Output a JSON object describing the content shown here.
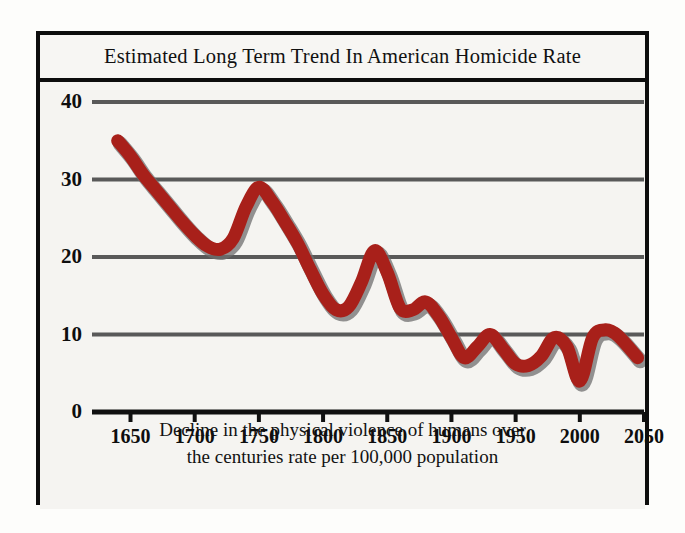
{
  "figure": {
    "title": "Estimated Long Term Trend In American Homicide Rate",
    "caption_line_1": "Decline in the physical violence of humans over",
    "caption_line_2": "the centuries rate per 100,000 population",
    "colors": {
      "line": "#a8201a",
      "line_shadow": "#6f6f6f",
      "gridline": "#595959",
      "axis": "#101010",
      "frame": "#0d0d0d",
      "background": "#f5f4f1",
      "text": "#111111"
    }
  },
  "chart_data": {
    "type": "line",
    "title": "Estimated Long Term Trend In American Homicide Rate",
    "subtitle": "Decline in the physical violence of humans over the centuries rate per 100,000 population",
    "xlabel": "",
    "ylabel": "",
    "xlim": [
      1620,
      2050
    ],
    "ylim": [
      0,
      40
    ],
    "grid": true,
    "legend": "none",
    "xticks": [
      1650,
      1700,
      1750,
      1800,
      1850,
      1900,
      1950,
      2000,
      2050
    ],
    "yticks": [
      0,
      10,
      20,
      30,
      40
    ],
    "series": [
      {
        "name": "American homicide rate (per 100,000 population)",
        "color": "#a8201a",
        "x": [
          1640,
          1650,
          1660,
          1670,
          1680,
          1690,
          1700,
          1710,
          1720,
          1730,
          1740,
          1750,
          1760,
          1770,
          1780,
          1790,
          1800,
          1810,
          1820,
          1830,
          1840,
          1850,
          1860,
          1870,
          1880,
          1890,
          1900,
          1910,
          1920,
          1930,
          1940,
          1950,
          1960,
          1970,
          1980,
          1990,
          2000,
          2010,
          2020,
          2030,
          2045
        ],
        "y": [
          35.0,
          33.0,
          30.6,
          28.6,
          26.6,
          24.6,
          22.8,
          21.4,
          21.0,
          22.4,
          26.5,
          29.0,
          27.2,
          24.6,
          21.8,
          18.4,
          15.2,
          13.2,
          13.6,
          16.8,
          20.8,
          18.0,
          13.4,
          13.2,
          14.2,
          12.4,
          9.6,
          7.0,
          8.4,
          10.0,
          8.2,
          6.2,
          6.0,
          7.2,
          9.6,
          8.4,
          4.0,
          9.6,
          10.6,
          9.8,
          7.0
        ]
      }
    ],
    "annotations": []
  }
}
